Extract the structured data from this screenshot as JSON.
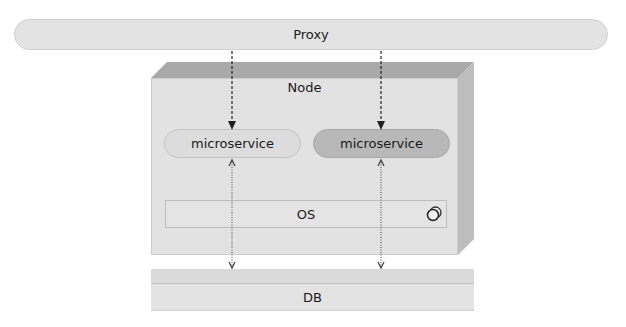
{
  "diagram": {
    "proxy": {
      "label": "Proxy"
    },
    "node": {
      "label": "Node",
      "microservices": [
        {
          "label": "microservice",
          "shade": "light"
        },
        {
          "label": "microservice",
          "shade": "dark"
        }
      ],
      "os": {
        "label": "OS",
        "icon": "circles-icon"
      }
    },
    "db": {
      "label": "DB"
    },
    "connections": [
      {
        "from": "proxy",
        "to": "microservice-1",
        "style": "dashed",
        "direction": "down"
      },
      {
        "from": "proxy",
        "to": "microservice-2",
        "style": "dashed",
        "direction": "down"
      },
      {
        "from": "microservice-1",
        "to": "db",
        "style": "dotted",
        "direction": "both"
      },
      {
        "from": "microservice-2",
        "to": "db",
        "style": "dotted",
        "direction": "both"
      }
    ]
  }
}
